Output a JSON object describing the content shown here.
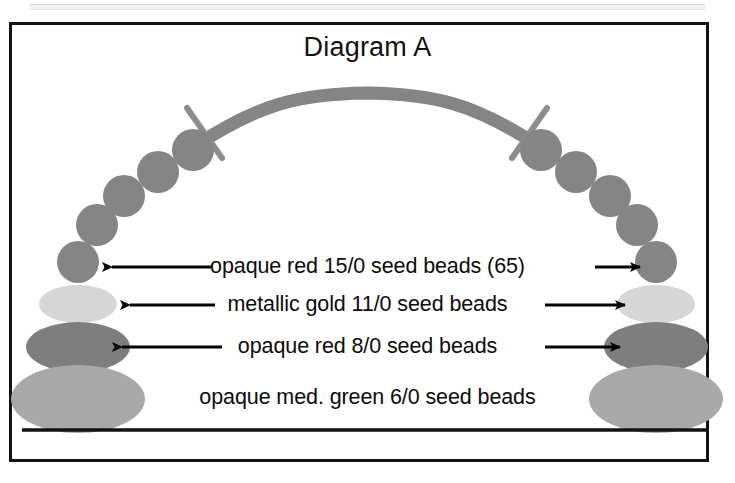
{
  "figure": {
    "title": "Diagram A",
    "background_color": "#ffffff",
    "frame_color": "#131313"
  },
  "labels": [
    {
      "id": "red-15-0",
      "text": "opaque red 15/0 seed beads (65)",
      "count": 65,
      "bead_size": "15/0",
      "color_name": "opaque red",
      "has_left_arrow": true,
      "has_right_arrow": true,
      "swatch_color": "#8a8a8a"
    },
    {
      "id": "gold-11-0",
      "text": "metallic gold 11/0 seed beads",
      "bead_size": "11/0",
      "color_name": "metallic gold",
      "has_left_arrow": true,
      "has_right_arrow": true,
      "swatch_color": "#d4d4d4"
    },
    {
      "id": "red-8-0",
      "text": "opaque red 8/0 seed beads",
      "bead_size": "8/0",
      "color_name": "opaque red",
      "has_left_arrow": true,
      "has_right_arrow": true,
      "swatch_color": "#7e7e7e"
    },
    {
      "id": "green-6-0",
      "text": "opaque med. green 6/0 seed beads",
      "bead_size": "6/0",
      "color_name": "opaque med. green",
      "has_left_arrow": false,
      "has_right_arrow": false,
      "swatch_color": "#a9a9a9"
    }
  ],
  "diagram": {
    "arch_color": "#808080",
    "tick_color": "#8a8a8a",
    "baseline_color": "#121212",
    "arrow_color": "#050505",
    "strand_note": "necklace arch of seed beads with graduated bead stacks at both ends"
  }
}
